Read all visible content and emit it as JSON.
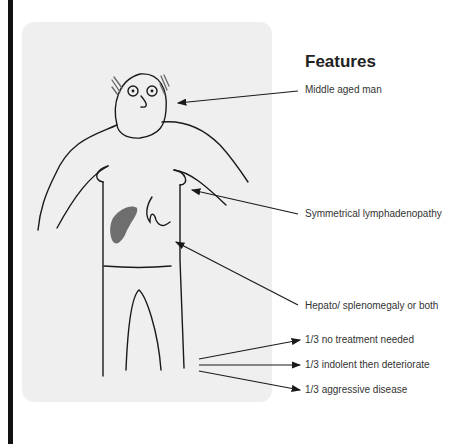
{
  "title": "Features",
  "colors": {
    "panel_bg": "#efefef",
    "line": "#1a1a1a",
    "liver_fill": "#6e6e6e",
    "left_bar": "#111111"
  },
  "features": [
    {
      "id": "age",
      "label": "Middle aged man"
    },
    {
      "id": "lymph",
      "label": "Symmetrical lymphadenopathy"
    },
    {
      "id": "organ",
      "label": "Hepato/ splenomegaly or both"
    },
    {
      "id": "prog1",
      "label": "1/3 no treatment needed"
    },
    {
      "id": "prog2",
      "label": "1/3 indolent then deteriorate"
    },
    {
      "id": "prog3",
      "label": "1/3 aggressive disease"
    }
  ]
}
